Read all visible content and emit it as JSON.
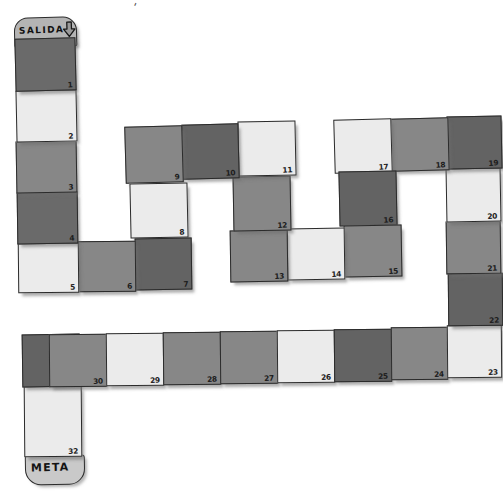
{
  "board": {
    "title": "SALIDA",
    "start_label": "SALIDA",
    "goal_label": "META",
    "start_icon": "down-arrow-icon",
    "stray_mark": "'",
    "colors": {
      "dark": "#6a6a6a",
      "mid": "#878787",
      "light": "#ebebeb",
      "darker": "#636363",
      "outline": "#2b2b2b",
      "background": "#ffffff",
      "cap_start": "#b4b4b4",
      "cap_goal": "#c9c9c9"
    },
    "total_cells": 32,
    "cells": [
      {
        "n": "1",
        "shade": "dark",
        "x": 15,
        "y": 38,
        "w": 61,
        "h": 53,
        "rot": -1.4
      },
      {
        "n": "2",
        "shade": "light",
        "x": 16,
        "y": 90,
        "w": 61,
        "h": 52,
        "rot": -1.2
      },
      {
        "n": "3",
        "shade": "mid",
        "x": 16,
        "y": 141,
        "w": 61,
        "h": 52,
        "rot": -1.0
      },
      {
        "n": "4",
        "shade": "dark",
        "x": 17,
        "y": 192,
        "w": 61,
        "h": 52,
        "rot": -0.8
      },
      {
        "n": "5",
        "shade": "light",
        "x": 18,
        "y": 243,
        "w": 61,
        "h": 50,
        "rot": -0.6
      },
      {
        "n": "6",
        "shade": "mid",
        "x": 78,
        "y": 241,
        "w": 58,
        "h": 51,
        "rot": -0.6
      },
      {
        "n": "7",
        "shade": "darker",
        "x": 135,
        "y": 238,
        "w": 57,
        "h": 52,
        "rot": -0.8
      },
      {
        "n": "8",
        "shade": "light",
        "x": 130,
        "y": 183,
        "w": 58,
        "h": 55,
        "rot": -1.2
      },
      {
        "n": "9",
        "shade": "mid",
        "x": 125,
        "y": 126,
        "w": 58,
        "h": 57,
        "rot": -1.6
      },
      {
        "n": "10",
        "shade": "darker",
        "x": 182,
        "y": 124,
        "w": 57,
        "h": 55,
        "rot": -1.4
      },
      {
        "n": "11",
        "shade": "light",
        "x": 238,
        "y": 121,
        "w": 58,
        "h": 55,
        "rot": -1.2
      },
      {
        "n": "12",
        "shade": "mid",
        "x": 233,
        "y": 176,
        "w": 58,
        "h": 55,
        "rot": -1.0
      },
      {
        "n": "13",
        "shade": "mid",
        "x": 230,
        "y": 230,
        "w": 58,
        "h": 52,
        "rot": -0.8
      },
      {
        "n": "14",
        "shade": "light",
        "x": 287,
        "y": 228,
        "w": 58,
        "h": 52,
        "rot": -0.8
      },
      {
        "n": "15",
        "shade": "mid",
        "x": 344,
        "y": 225,
        "w": 58,
        "h": 52,
        "rot": -1.0
      },
      {
        "n": "16",
        "shade": "darker",
        "x": 339,
        "y": 171,
        "w": 58,
        "h": 55,
        "rot": -1.2
      },
      {
        "n": "17",
        "shade": "light",
        "x": 334,
        "y": 119,
        "w": 58,
        "h": 54,
        "rot": -1.6
      },
      {
        "n": "18",
        "shade": "mid",
        "x": 391,
        "y": 118,
        "w": 58,
        "h": 53,
        "rot": -1.4
      },
      {
        "n": "19",
        "shade": "darker",
        "x": 447,
        "y": 116,
        "w": 55,
        "h": 53,
        "rot": -1.2
      },
      {
        "n": "20",
        "shade": "light",
        "x": 446,
        "y": 168,
        "w": 55,
        "h": 54,
        "rot": -1.0
      },
      {
        "n": "21",
        "shade": "mid",
        "x": 446,
        "y": 221,
        "w": 55,
        "h": 53,
        "rot": -0.8
      },
      {
        "n": "22",
        "shade": "darker",
        "x": 448,
        "y": 273,
        "w": 55,
        "h": 53,
        "rot": -0.6
      },
      {
        "n": "23",
        "shade": "light",
        "x": 447,
        "y": 325,
        "w": 55,
        "h": 53,
        "rot": -0.5
      },
      {
        "n": "24",
        "shade": "mid",
        "x": 391,
        "y": 327,
        "w": 57,
        "h": 53,
        "rot": -0.5
      },
      {
        "n": "25",
        "shade": "darker",
        "x": 334,
        "y": 329,
        "w": 58,
        "h": 53,
        "rot": -0.5
      },
      {
        "n": "26",
        "shade": "light",
        "x": 277,
        "y": 330,
        "w": 58,
        "h": 53,
        "rot": -0.5
      },
      {
        "n": "27",
        "shade": "mid",
        "x": 220,
        "y": 331,
        "w": 58,
        "h": 53,
        "rot": -0.5
      },
      {
        "n": "28",
        "shade": "mid",
        "x": 163,
        "y": 332,
        "w": 58,
        "h": 53,
        "rot": -0.5
      },
      {
        "n": "29",
        "shade": "light",
        "x": 106,
        "y": 333,
        "w": 58,
        "h": 53,
        "rot": -0.5
      },
      {
        "n": "30",
        "shade": "mid",
        "x": 49,
        "y": 334,
        "w": 58,
        "h": 53,
        "rot": -0.5
      },
      {
        "n": "31",
        "shade": "darker",
        "x": 22,
        "y": 334,
        "w": 58,
        "h": 53,
        "rot": -0.8
      },
      {
        "n": "32",
        "shade": "light",
        "x": 24,
        "y": 386,
        "w": 58,
        "h": 71,
        "rot": -0.5
      }
    ]
  }
}
